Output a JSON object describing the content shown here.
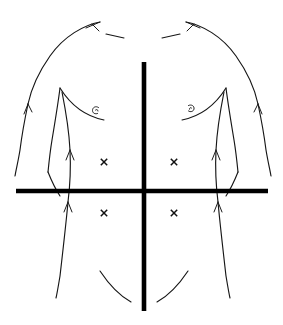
{
  "figure": {
    "view": "anterior",
    "background_color": "#ffffff",
    "line_color": "#161616",
    "quadrant_line_color": "#000000",
    "mark_color": "#111111",
    "width": 283,
    "height": 325
  },
  "quadrant_lines": {
    "vertical": {
      "label": "median vertical line",
      "x": 144,
      "y1": 62,
      "y2": 311,
      "stroke_width": 4.6
    },
    "horizontal": {
      "label": "transumbilical horizontal line",
      "y": 191,
      "x1": 16,
      "x2": 268,
      "stroke_width": 4.6
    }
  },
  "marks": [
    {
      "id": "ruq",
      "label": "x",
      "quadrant": "right-upper-quadrant",
      "x": 104,
      "y": 162
    },
    {
      "id": "luq",
      "label": "x",
      "quadrant": "left-upper-quadrant",
      "x": 174,
      "y": 162
    },
    {
      "id": "rlq",
      "label": "x",
      "quadrant": "right-lower-quadrant",
      "x": 104,
      "y": 213
    },
    {
      "id": "llq",
      "label": "x",
      "quadrant": "left-lower-quadrant",
      "x": 174,
      "y": 213
    }
  ],
  "anatomy_marks": [
    {
      "id": "nipple-right",
      "label": "nipple",
      "x": 95,
      "y": 110
    },
    {
      "id": "nipple-left",
      "label": "nipple",
      "x": 192,
      "y": 108
    }
  ],
  "outline_paths": {
    "shoulder_right": "M 100,22 C 84,25 64,36 50,56 C 38,73 31,90 28,104",
    "shoulder_right_barb": "M 100,22 L 86,28 M 92,24 L 99,31",
    "shoulder_left": "M 186,22 C 202,25 222,36 236,56 C 248,73 255,90 258,104",
    "shoulder_left_barb": "M 186,22 L 200,28 M 194,24 L 187,31",
    "clavicle_right": "M 106,34 L 124,38",
    "clavicle_left": "M 180,34 L 162,38",
    "arm_right_outer": "M 28,104 C 25,118 22,134 20,150 C 18,162 16,170 15,176",
    "arm_right_outer_barb": "M 28,104 L 24,114 M 28,104 L 32,112",
    "arm_right_inner": "M 60,88 C 58,104 55,122 52,140 C 50,152 49,162 48,172",
    "arm_left_outer": "M 258,104 C 261,118 264,134 266,150 C 268,162 270,170 271,176",
    "arm_left_outer_barb": "M 258,104 L 262,114 M 258,104 L 254,112",
    "arm_left_inner": "M 226,88 C 228,104 231,122 234,140 C 236,152 237,162 238,172",
    "pec_right": "M 60,88 C 70,104 84,116 104,120",
    "pec_left": "M 226,88 C 216,104 202,116 182,120",
    "flank_right": "M 62,92 C 66,112 69,130 70,150 C 71,170 70,186 68,202 C 66,224 63,250 60,276 C 58,288 57,294 56,298",
    "flank_right_barb": "M 70,150 L 66,160 M 70,150 L 74,160",
    "flank_right_barb2": "M 68,202 L 64,212 M 68,202 L 72,212",
    "flank_left": "M 224,92 C 220,112 217,130 216,150 C 215,170 216,186 218,202 C 220,224 223,250 226,276 C 228,288 229,294 230,298",
    "flank_left_barb": "M 216,150 L 212,160 M 216,150 L 220,160",
    "flank_left_barb2": "M 218,202 L 214,212 M 218,202 L 222,212",
    "waist_right": "M 48,172 C 52,182 56,190 60,196",
    "waist_left": "M 238,172 C 234,182 230,190 226,196",
    "inguinal_right": "M 100,271 C 110,286 120,296 131,302",
    "inguinal_left": "M 188,271 C 178,286 168,296 157,302"
  }
}
